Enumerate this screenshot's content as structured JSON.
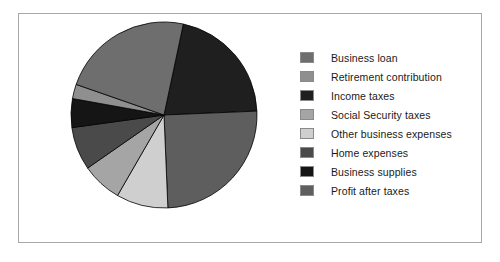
{
  "chart_data": {
    "type": "pie",
    "title": "",
    "legend_position": "right",
    "labels": [
      "Business loan",
      "Retirement contribution",
      "Income taxes",
      "Social Security taxes",
      "Other business expenses",
      "Home expenses",
      "Business supplies",
      "Profit after taxes"
    ],
    "values": [
      23.0,
      2.5,
      21.0,
      7.0,
      9.0,
      7.5,
      5.0,
      25.0
    ],
    "colors": [
      "#6e6e6e",
      "#8f8f8f",
      "#1f1f1f",
      "#a5a5a5",
      "#cfcfcf",
      "#4a4a4a",
      "#151515",
      "#5e5e5e"
    ],
    "slice_order_clockwise_from_top": [
      "Income taxes",
      "Profit after taxes",
      "Other business expenses",
      "Social Security taxes",
      "Home expenses",
      "Business supplies",
      "Retirement contribution",
      "Business loan"
    ],
    "start_angle_deg": -78,
    "direction": "clockwise",
    "edge_color": "#000000"
  },
  "legend": {
    "items": [
      {
        "label": "Business loan",
        "color": "#6e6e6e"
      },
      {
        "label": "Retirement contribution",
        "color": "#8f8f8f"
      },
      {
        "label": "Income taxes",
        "color": "#1f1f1f"
      },
      {
        "label": "Social Security taxes",
        "color": "#a5a5a5"
      },
      {
        "label": "Other business expenses",
        "color": "#cfcfcf"
      },
      {
        "label": "Home expenses",
        "color": "#4a4a4a"
      },
      {
        "label": "Business supplies",
        "color": "#151515"
      },
      {
        "label": "Profit after taxes",
        "color": "#5e5e5e"
      }
    ]
  },
  "figure": {
    "border_color": "#a8a8a8",
    "background": "#ffffff"
  }
}
